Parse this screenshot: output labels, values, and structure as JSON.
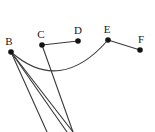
{
  "figure": {
    "background_color": "#ffffff",
    "stroke_color": "#3a3a3a",
    "dot_color": "#141414",
    "label_color": "#1a1a1a",
    "width": 155,
    "height": 132
  },
  "points": [
    {
      "id": "B",
      "label": "B",
      "x": 11,
      "y": 52,
      "label_x": 9,
      "label_y": 45
    },
    {
      "id": "C",
      "label": "C",
      "x": 42,
      "y": 45,
      "label_x": 41,
      "label_y": 38
    },
    {
      "id": "D",
      "label": "D",
      "x": 78,
      "y": 41,
      "label_x": 78,
      "label_y": 34
    },
    {
      "id": "E",
      "label": "E",
      "x": 108,
      "y": 40,
      "label_x": 107,
      "label_y": 33
    },
    {
      "id": "F",
      "label": "F",
      "x": 140,
      "y": 50,
      "label_x": 141,
      "label_y": 43
    }
  ],
  "segments": [
    {
      "id": "CD",
      "from": "C",
      "to": "D",
      "x1": 42,
      "y1": 45,
      "x2": 78,
      "y2": 41
    },
    {
      "id": "EF",
      "from": "E",
      "to": "F",
      "x1": 108,
      "y1": 40,
      "x2": 140,
      "y2": 50
    },
    {
      "id": "B-ray-1",
      "from": "B",
      "to": "edge-bottom",
      "x1": 11,
      "y1": 52,
      "x2": 47,
      "y2": 132
    },
    {
      "id": "B-ray-2",
      "from": "B",
      "to": "edge-bottom",
      "x1": 11,
      "y1": 52,
      "x2": 67,
      "y2": 132
    },
    {
      "id": "B-ray-3",
      "from": "B",
      "to": "edge-bottom",
      "x1": 11,
      "y1": 52,
      "x2": 73,
      "y2": 132
    },
    {
      "id": "C-ray-1",
      "from": "C",
      "to": "edge-bottom",
      "x1": 42,
      "y1": 45,
      "x2": 73,
      "y2": 132
    }
  ],
  "arcs": [
    {
      "id": "arc-BE",
      "from": "B",
      "to": "E",
      "x1": 11,
      "y1": 52,
      "cx": 60,
      "cy": 95,
      "x2": 108,
      "y2": 40
    }
  ]
}
